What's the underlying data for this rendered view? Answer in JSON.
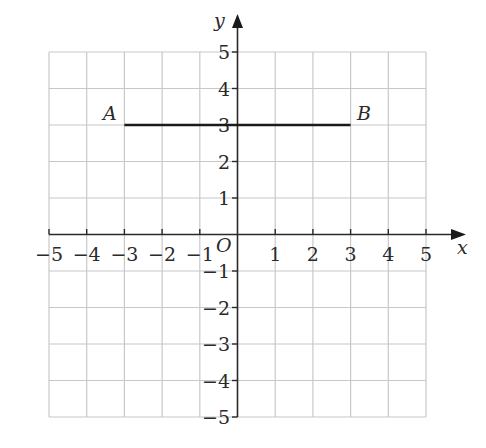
{
  "diagram": {
    "type": "coordinate-plane",
    "x_axis_label": "x",
    "y_axis_label": "y",
    "origin_label": "O",
    "x_range": [
      -5,
      5
    ],
    "y_range": [
      -5,
      5
    ],
    "x_ticks": [
      "−5",
      "−4",
      "−3",
      "−2",
      "−1",
      "1",
      "2",
      "3",
      "4",
      "5"
    ],
    "y_ticks_positive": [
      "5",
      "4",
      "3",
      "2",
      "1"
    ],
    "y_ticks_negative": [
      "−1",
      "−2",
      "−3",
      "−4",
      "−5"
    ],
    "grid": true,
    "colors": {
      "grid": "#c8c8c8",
      "axes": "#2a2a2a",
      "segment": "#1a1a1a",
      "text": "#2a2a2a"
    },
    "points": [
      {
        "label": "A",
        "x": -3,
        "y": 3
      },
      {
        "label": "B",
        "x": 3,
        "y": 3
      }
    ],
    "segments": [
      {
        "from": "A",
        "to": "B",
        "description": "horizontal line segment AB at y = 3"
      }
    ]
  }
}
